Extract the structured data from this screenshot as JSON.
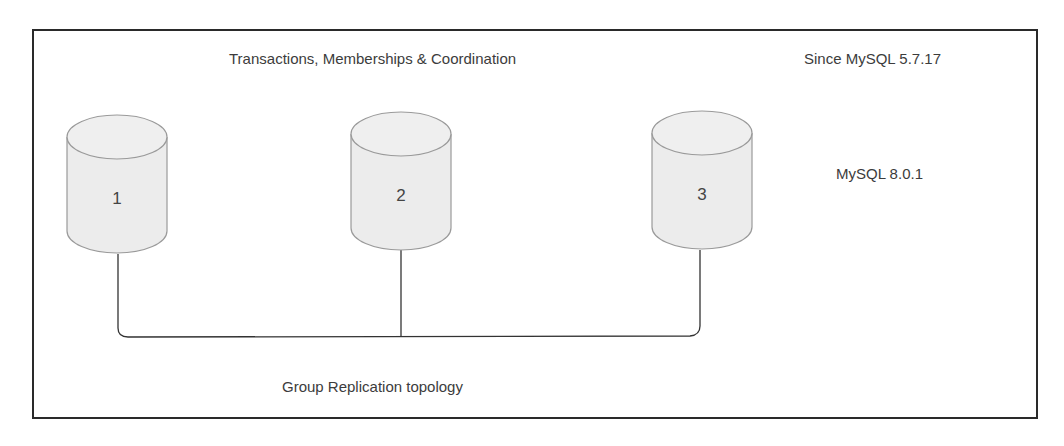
{
  "diagram": {
    "header_label": "Transactions, Memberships & Coordination",
    "version_since": "Since MySQL 5.7.17",
    "version_current": "MySQL 8.0.1",
    "footer_label": "Group Replication topology",
    "nodes": [
      {
        "id": "1",
        "label": "1"
      },
      {
        "id": "2",
        "label": "2"
      },
      {
        "id": "3",
        "label": "3"
      }
    ],
    "colors": {
      "cylinder_fill": "#ececec",
      "cylinder_stroke": "#9a9a9a",
      "line": "#333333",
      "frame": "#2a2a2a"
    }
  }
}
